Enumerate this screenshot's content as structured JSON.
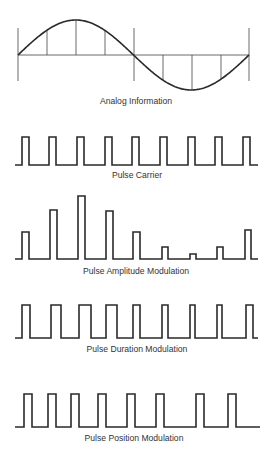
{
  "panels": [
    {
      "id": "analog",
      "label": "Analog Information"
    },
    {
      "id": "carrier",
      "label": "Pulse Carrier"
    },
    {
      "id": "pam",
      "label": "Pulse Amplitude Modulation"
    },
    {
      "id": "pdm",
      "label": "Pulse Duration Modulation"
    },
    {
      "id": "ppm",
      "label": "Pulse Position Modulation"
    }
  ],
  "colors": {
    "stroke": "#2a2a2a",
    "text": "#333333",
    "background": "#ffffff"
  },
  "waveforms": {
    "analog": {
      "x_start": 18,
      "x_end": 249,
      "baseline_y": 55,
      "amplitude": 35,
      "sample_x": [
        47,
        76,
        105,
        163,
        192,
        221
      ],
      "marker_x": [
        18,
        134,
        249
      ]
    },
    "carrier": {
      "baseline_y": 165,
      "top_y": 137,
      "pulses": [
        [
          22,
          29
        ],
        [
          49,
          56
        ],
        [
          77,
          84
        ],
        [
          105,
          112
        ],
        [
          132,
          139
        ],
        [
          160,
          167
        ],
        [
          188,
          195
        ],
        [
          215,
          222
        ],
        [
          243,
          250
        ]
      ],
      "x_start": 15,
      "x_end": 258
    },
    "pam": {
      "baseline_y": 259,
      "pulses": [
        [
          22,
          29,
          232
        ],
        [
          50,
          57,
          210
        ],
        [
          78,
          85,
          196
        ],
        [
          106,
          113,
          211
        ],
        [
          133,
          140,
          232
        ],
        [
          162,
          168,
          247
        ],
        [
          190,
          196,
          254
        ],
        [
          217,
          223,
          247
        ],
        [
          245,
          251,
          230
        ]
      ],
      "x_start": 15,
      "x_end": 258
    },
    "pdm": {
      "baseline_y": 338,
      "top_y": 305,
      "pulses": [
        [
          22,
          30
        ],
        [
          51,
          61
        ],
        [
          79,
          91
        ],
        [
          106,
          117
        ],
        [
          133,
          140
        ],
        [
          162,
          168
        ],
        [
          190,
          195
        ],
        [
          217,
          222
        ],
        [
          246,
          253
        ]
      ],
      "x_start": 15,
      "x_end": 258
    },
    "ppm": {
      "baseline_y": 427,
      "top_y": 394,
      "pulses": [
        [
          24,
          32
        ],
        [
          48,
          56
        ],
        [
          71,
          79
        ],
        [
          98,
          106
        ],
        [
          127,
          135
        ],
        [
          156,
          164
        ],
        [
          196,
          204
        ],
        [
          228,
          236
        ]
      ],
      "x_start": 15,
      "x_end": 260
    }
  }
}
